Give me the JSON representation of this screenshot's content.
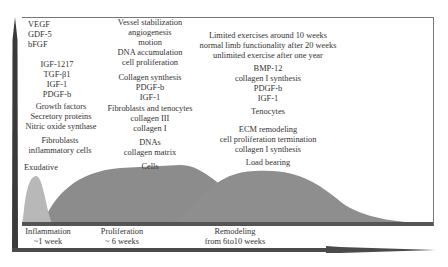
{
  "diagram": {
    "type": "tendon-healing-phases",
    "colors": {
      "exudative_curve": "#b8b8b8",
      "cells_curve": "#8c8c8c",
      "load_bearing_curve": "#8e8e8e",
      "axis": "#3a3a3a",
      "frame": "#777777"
    },
    "columns": {
      "inflammation": {
        "growth_list": [
          "VEGF",
          "GDF-5",
          "bFGF"
        ],
        "growth_list2": [
          "IGF-1217",
          "TGF-β1",
          "IGF-1",
          "PDGF-b"
        ],
        "products": [
          "Growth factors",
          "Secretory proteins",
          "Nitric oxide synthase"
        ],
        "cells": [
          "Fibroblasts",
          "inflammatory cells"
        ],
        "curve_label": "Exudative"
      },
      "proliferation": {
        "processes": [
          "Vessel stabilization",
          "angiogenesis",
          "motion",
          "DNA accumulation",
          "cell proliferation"
        ],
        "synthesis": [
          "Collagen synthesis",
          "PDGF-b",
          "IGF-1"
        ],
        "cells": [
          "Fibroblasts and tenocytes",
          "collagen III",
          "collagen I"
        ],
        "matrix": [
          "DNAs",
          "collagen matrix"
        ],
        "curve_label": "Cells"
      },
      "remodeling": {
        "exercise": [
          "Limited exercises around 10 weeks",
          "normal limb functionality after 20 weeks",
          "unlimited exercise after one year"
        ],
        "factors": [
          "BMP-12",
          "collagen I synthesis",
          "PDGF-b",
          "IGF-1"
        ],
        "cells": [
          "Tenocytes"
        ],
        "processes": [
          "ECM remodeling",
          "cell proliferation termination",
          "collagen I synthesis"
        ],
        "curve_label": "Load bearing"
      }
    },
    "phases": [
      {
        "name": "Inflammation",
        "duration": "~1 week"
      },
      {
        "name": "Proliferation",
        "duration": "~ 6 weeks"
      },
      {
        "name": "Remodeling",
        "duration": "from 6to10 weeks"
      }
    ]
  }
}
